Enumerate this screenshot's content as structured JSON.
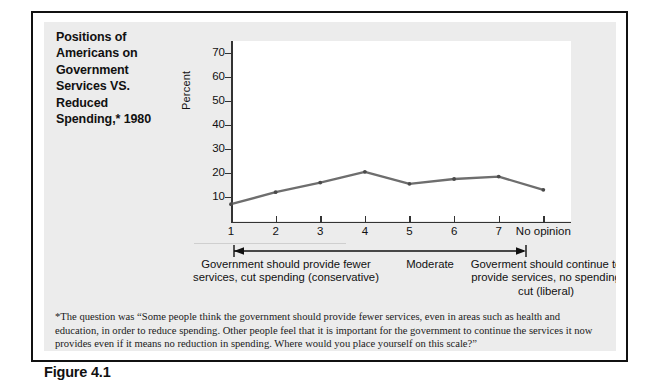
{
  "figure": {
    "number_label": "Figure 4.1",
    "title": "Positions of Americans on Government Services VS. Reduced Spending,* 1980",
    "title_lines": [
      "Positions of",
      "Americans on",
      "Government",
      "Services VS.",
      "Reduced",
      "Spending,* 1980"
    ]
  },
  "annotation": {
    "left_caption": "Government should provide fewer services, cut spending (conservative)",
    "mid_caption": "Moderate",
    "right_caption": "Goverment should continue to provide services, no spending cut (liberal)"
  },
  "footnote": {
    "question": "*The question was “Some people think the government should provide fewer services, even in areas such as health and education, in order to reduce spending. Other people feel that it is important for the government to continue the services it now provides even if it means no reduction in spending. Where would you place yourself on this scale?”",
    "source": "Source: Data from American National Election Study, 1980, Center for Political Studies, University of Michigan."
  },
  "colors": {
    "line": "#6e6e6e",
    "axis": "#333333",
    "panel_background": "#ececec",
    "plot_background": "#ffffff",
    "frame_border": "#111111",
    "text": "#111111"
  },
  "chart_data": {
    "type": "line",
    "title": "Positions of Americans on Government Services VS. Reduced Spending,* 1980",
    "xlabel": "",
    "ylabel": "Percent",
    "categories": [
      "1",
      "2",
      "3",
      "4",
      "5",
      "6",
      "7",
      "No opinion"
    ],
    "values": [
      7,
      12,
      16,
      20.5,
      15.5,
      17.5,
      18.5,
      13
    ],
    "ylim": [
      0,
      75
    ],
    "yticks": [
      10,
      20,
      30,
      40,
      50,
      60,
      70
    ],
    "ytick_labels": [
      "10",
      "20",
      "30",
      "40",
      "50",
      "60",
      "70"
    ],
    "xtick_labels": [
      "1",
      "2",
      "3",
      "4",
      "5",
      "6",
      "7",
      "No opinion"
    ],
    "grid": false,
    "legend": false,
    "markers": true,
    "series": [
      {
        "name": "Percent of Americans",
        "values": [
          7,
          12,
          16,
          20.5,
          15.5,
          17.5,
          18.5,
          13
        ]
      }
    ]
  }
}
